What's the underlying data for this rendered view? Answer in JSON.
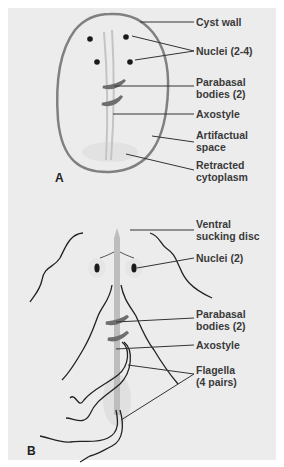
{
  "panel_a": {
    "letter": "A",
    "labels": {
      "cyst_wall": "Cyst wall",
      "nuclei": "Nuclei (2-4)",
      "parabasal": "Parabasal\nbodies (2)",
      "axostyle": "Axostyle",
      "artifactual": "Artifactual\nspace",
      "retracted": "Retracted\ncytoplasm"
    }
  },
  "panel_b": {
    "letter": "B",
    "labels": {
      "ventral_disc": "Ventral\nsucking disc",
      "nuclei": "Nuclei (2)",
      "parabasal": "Parabasal\nbodies (2)",
      "axostyle": "Axostyle",
      "flagella": "Flagella\n(4 pairs)"
    }
  },
  "colors": {
    "background": "#ececec",
    "cyst_wall": "#808080",
    "leader_line": "#333333",
    "parabasal": "#6e6e6e",
    "axostyle": "#b8b8b8",
    "text": "#3a3a3a"
  }
}
